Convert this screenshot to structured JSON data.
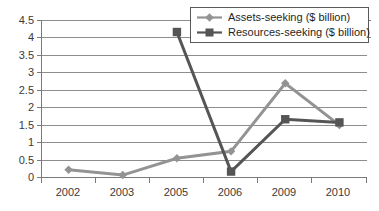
{
  "chart_data": {
    "type": "line",
    "title": "",
    "xlabel": "",
    "ylabel": "",
    "categories": [
      "2002",
      "2003",
      "2005",
      "2006",
      "2009",
      "2010"
    ],
    "ylim": [
      0,
      4.5
    ],
    "ytick_values": [
      "0",
      "0.5",
      "1",
      "1.5",
      "2",
      "2.5",
      "3",
      "3.5",
      "4",
      "4.5"
    ],
    "grid": true,
    "legend_position": "top-right",
    "series": [
      {
        "name": "Assets-seeking ($ billion)",
        "marker": "diamond",
        "color": "#939393",
        "values": [
          0.22,
          0.07,
          0.55,
          0.75,
          2.7,
          1.5
        ]
      },
      {
        "name": "Resources-seeking ($ billion)",
        "marker": "square",
        "color": "#555555",
        "values": [
          null,
          null,
          4.17,
          0.17,
          1.67,
          1.58
        ]
      }
    ]
  },
  "axes": {
    "y_labels": [
      "4.5",
      "4",
      "3.5",
      "3",
      "2.5",
      "2",
      "1.5",
      "1",
      "0.5",
      "0"
    ],
    "x_labels": [
      "2002",
      "2003",
      "2005",
      "2006",
      "2009",
      "2010"
    ]
  },
  "legend": {
    "items": [
      {
        "label": "Assets-seeking ($ billion)",
        "marker": "diamond-marker",
        "color": "#939393"
      },
      {
        "label": "Resources-seeking ($ billion)",
        "marker": "square-marker",
        "color": "#555555"
      }
    ]
  },
  "colors": {
    "assets_series": "#939393",
    "resources_series": "#555555",
    "gridline": "#8d8d8d",
    "axis": "#7a7a7a",
    "text": "#3a3a3a",
    "background": "#ffffff"
  }
}
